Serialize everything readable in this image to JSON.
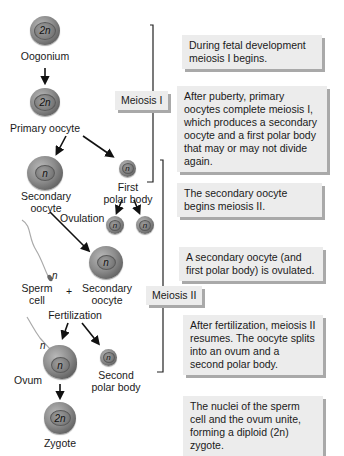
{
  "cells": {
    "oogonium": {
      "label": "Oogonium",
      "ploidy": "2n"
    },
    "primary_oocyte": {
      "label": "Primary oocyte",
      "ploidy": "2n"
    },
    "secondary_oocyte": {
      "label_line1": "Secondary",
      "label_line2": "oocyte",
      "ploidy": "n"
    },
    "first_polar_body": {
      "label_line1": "First",
      "label_line2": "polar body",
      "ploidy": "n"
    },
    "polar_body_a": {
      "ploidy": "n"
    },
    "polar_body_b": {
      "ploidy": "n"
    },
    "sperm_cell": {
      "label_line1": "Sperm",
      "label_line2": "cell",
      "ploidy": "n"
    },
    "plus": "+",
    "ovulated_secondary_oocyte": {
      "label_line1": "Secondary",
      "label_line2": "oocyte",
      "ploidy": "n"
    },
    "ovum": {
      "label": "Ovum",
      "ploidy": "n",
      "sperm_ploidy": "n"
    },
    "second_polar_body": {
      "label_line1": "Second",
      "label_line2": "polar body",
      "ploidy": "n"
    },
    "zygote": {
      "label": "Zygote",
      "ploidy": "2n"
    }
  },
  "process_labels": {
    "ovulation": "Ovulation",
    "fertilization": "Fertilization"
  },
  "phases": {
    "meiosis_1": "Meiosis I",
    "meiosis_2": "Meiosis II"
  },
  "descriptions": [
    "During fetal development meiosis I begins.",
    "After puberty, primary oocytes complete meiosis I, which produces a secondary oocyte and a first polar body that may or may not divide again.",
    "The secondary oocyte begins meiosis II.",
    "A secondary oocyte (and first polar body) is ovulated.",
    "After fertilization, meiosis II resumes. The oocyte splits into an ovum and a second polar body.",
    "The nuclei of the sperm cell and the ovum unite, forming a diploid (2n) zygote."
  ]
}
